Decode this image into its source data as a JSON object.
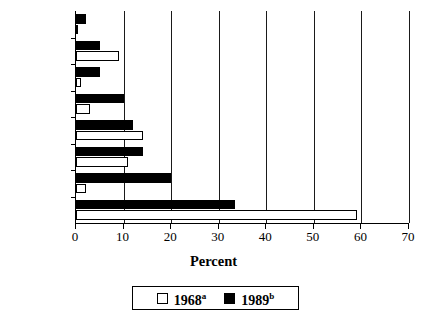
{
  "chart_data": {
    "type": "bar",
    "orientation": "horizontal",
    "title": "",
    "xlabel": "Percent",
    "ylabel": "",
    "xlim": [
      0,
      70
    ],
    "xticks": [
      0,
      10,
      20,
      30,
      40,
      50,
      60,
      70
    ],
    "xticklabels": [
      "0",
      "10",
      "20",
      "30",
      "40",
      "50",
      "60",
      "70"
    ],
    "grid": "vertical",
    "legend_position": "bottom-center",
    "categories": [
      "",
      "Friends",
      "",
      "Money",
      "",
      "Family",
      "",
      "Health"
    ],
    "visible_category_labels": [
      "Friends",
      "Money",
      "Family",
      "Health"
    ],
    "series": [
      {
        "name": "1968",
        "name_superscript": "a",
        "color": "#ffffff",
        "edge_color": "#000000",
        "values": [
          0.5,
          9,
          1,
          3,
          14,
          11,
          2,
          59
        ]
      },
      {
        "name": "1989",
        "name_superscript": "b",
        "color": "#000000",
        "edge_color": "#000000",
        "values": [
          2,
          5,
          5,
          10,
          12,
          14,
          20,
          33.5
        ]
      }
    ]
  },
  "axis": {
    "x_title": "Percent",
    "x_tick_labels": [
      "0",
      "10",
      "20",
      "30",
      "40",
      "50",
      "60",
      "70"
    ],
    "y_tick_labels": [
      "Friends",
      "Money",
      "Family",
      "Health"
    ]
  },
  "legend": {
    "entries": [
      {
        "label": "1968",
        "superscript": "a",
        "swatch": "white-square"
      },
      {
        "label": "1989",
        "superscript": "b",
        "swatch": "black-square"
      }
    ]
  }
}
